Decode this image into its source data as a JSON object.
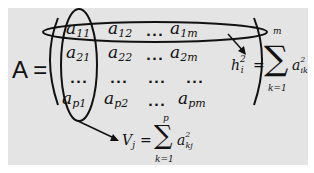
{
  "matrix": {
    "name": "A",
    "equals": "=",
    "rows": [
      [
        {
          "base": "a",
          "sub": "11"
        },
        {
          "base": "a",
          "sub": "12"
        },
        {
          "dots": "..."
        },
        {
          "base": "a",
          "sub": "1m"
        }
      ],
      [
        {
          "base": "a",
          "sub": "21"
        },
        {
          "base": "a",
          "sub": "22"
        },
        {
          "dots": "..."
        },
        {
          "base": "a",
          "sub": "2m"
        }
      ],
      [
        {
          "dots": "..."
        },
        {
          "dots": "..."
        },
        {
          "dots": "..."
        },
        {
          "dots": "..."
        }
      ],
      [
        {
          "base": "a",
          "sub": "p1"
        },
        {
          "base": "a",
          "sub": "p2"
        },
        {
          "dots": "..."
        },
        {
          "base": "a",
          "sub": "pm"
        }
      ]
    ]
  },
  "row_formula": {
    "lhs": "h",
    "lhs_sub": "i",
    "lhs_sup": "2",
    "equals": "=",
    "sigma": "∑",
    "upper": "m",
    "lower": "k=1",
    "term": "a",
    "term_sub": "ik",
    "term_sup": "2"
  },
  "col_formula": {
    "lhs": "V",
    "lhs_sub": "j",
    "equals": "=",
    "sigma": "∑",
    "upper": "p",
    "lower": "k=1",
    "term": "a",
    "term_sub": "kj",
    "term_sup": "2"
  },
  "colors": {
    "background": "#e4e4e4",
    "ink": "#111111"
  }
}
